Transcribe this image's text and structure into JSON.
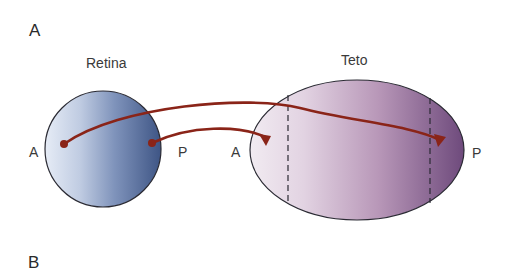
{
  "panels": {
    "a": "A",
    "b": "B"
  },
  "retina": {
    "title": "Retina",
    "left_label": "A",
    "right_label": "P",
    "gradient": [
      "#e6ecf6",
      "#9aaccc",
      "#3e5585"
    ]
  },
  "tectum": {
    "title": "Teto",
    "left_label": "A",
    "right_label": "P",
    "gradient": [
      "#f1ebf1",
      "#c8b0c8",
      "#6e4a7c"
    ]
  },
  "colors": {
    "axon": "#8a2418",
    "outline": "#2a2a33"
  }
}
